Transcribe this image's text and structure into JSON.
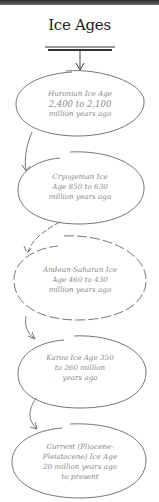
{
  "title": "Ice Ages",
  "nodes": [
    {
      "id": "huronian",
      "lines": [
        "Huronian Ice Age",
        "2,400 to 2,100",
        "million years ago"
      ]
    },
    {
      "id": "cryogenian",
      "lines": [
        "Cryogenian Ice",
        "Age 850 to 630",
        "million years ago"
      ]
    },
    {
      "id": "andean-saharan",
      "lines": [
        "Andean-Saharan Ice",
        "Age 460 to 430",
        "million years ago"
      ]
    },
    {
      "id": "karoo",
      "lines": [
        "Karoo Ice Age 350",
        "to 260 million",
        "years ago"
      ]
    },
    {
      "id": "current",
      "lines": [
        "Current (Pliocene-",
        "Pleistocene) Ice Age",
        "20 million years ago",
        "to present"
      ]
    }
  ],
  "colors": {
    "stroke": "#555555",
    "text": "#8a8a8a",
    "title": "#222222",
    "topbar": "#3a3a3a"
  }
}
